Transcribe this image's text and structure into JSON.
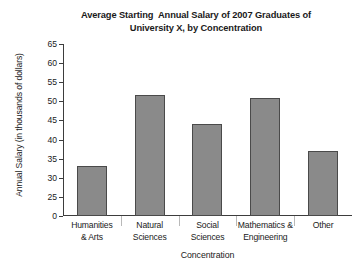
{
  "chart_data": {
    "type": "bar",
    "title": "Average Starting  Annual Salary of 2007 Graduates of\nUniversity X, by Concentration",
    "title_line1": "Average Starting  Annual Salary of 2007 Graduates of",
    "title_line2": "University X, by Concentration",
    "xlabel": "Concentration",
    "ylabel": "Annual Salary (in thousands of dollars)",
    "categories": [
      "Humanities\n& Arts",
      "Natural\nSciences",
      "Social\nSciences",
      "Mathematics &\nEngineering",
      "Other"
    ],
    "categories_flat": [
      "Humanities & Arts",
      "Natural Sciences",
      "Social Sciences",
      "Mathematics & Engineering",
      "Other"
    ],
    "values": [
      33,
      51.7,
      44,
      51,
      37
    ],
    "yticks": [
      0,
      25,
      30,
      35,
      40,
      45,
      50,
      55,
      60,
      65
    ],
    "ytick_labels": [
      "0",
      "25",
      "30",
      "35",
      "40",
      "45",
      "50",
      "55",
      "60",
      "65"
    ],
    "ylim": [
      0,
      65
    ],
    "axis_break": true,
    "axis_break_note": "y-axis jumps from 0 to 25",
    "grid": false,
    "legend": false,
    "bar_color": "#8a8a8a",
    "bar_edge_color": "#4a4a4a",
    "axis_color": "#3d3d3d",
    "background_color": "#ffffff"
  }
}
